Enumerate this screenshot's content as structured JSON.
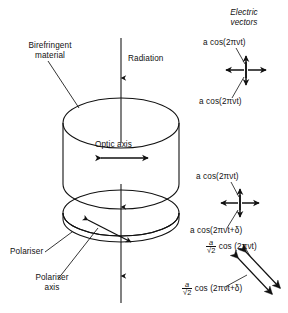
{
  "diagram": {
    "type": "optics-schematic",
    "background_color": "#ffffff",
    "line_color": "#111111"
  },
  "labels": {
    "birefringent_material": "Birefringent\nmaterial",
    "birefringent_material_line1": "Birefringent",
    "birefringent_material_line2": "material",
    "radiation": "Radiation",
    "optic_axis": "Optic axis",
    "polariser": "Polariser",
    "polariser_axis_line1": "Polariser",
    "polariser_axis_line2": "axis",
    "electric_vectors_line1": "Electric",
    "electric_vectors_line2": "vectors"
  },
  "formulas": {
    "top_upper": "a cos(2πνt)",
    "top_lower": "a cos(2πνt)",
    "mid_upper": "a cos(2πνt)",
    "mid_lower": "a cos(2πνt+δ)",
    "diag_upper_numerator": "a",
    "diag_upper_denominator": "√2",
    "diag_upper_rest": "cos (2πνt)",
    "diag_lower_numerator": "a",
    "diag_lower_denominator": "√2",
    "diag_lower_rest": "cos (2πνt+δ)"
  },
  "components": {
    "birefringent_cylinder": {
      "shape": "cylinder",
      "center_x": 121,
      "top_ellipse_y": 123,
      "bottom_ellipse_y": 184,
      "rx": 58,
      "ry": 25
    },
    "polariser_disc": {
      "shape": "thin-disc",
      "center_x": 121,
      "top_ellipse_y": 213,
      "bottom_ellipse_y": 254,
      "rx": 58,
      "ry": 23,
      "thickness": 6
    },
    "radiation_beam": {
      "x": 121,
      "top_y": 38,
      "bottom_y": 303,
      "direction": "downward"
    }
  },
  "arrows": {
    "optic_axis_arrow": {
      "type": "double-headed-horizontal",
      "x1": 99,
      "x2": 150,
      "y": 158
    },
    "polariser_axis_arrow": {
      "type": "double-headed-diagonal",
      "x1": 86,
      "y1": 219,
      "x2": 132,
      "y2": 243
    },
    "electric_vector_cross_top": {
      "type": "four-way-cross",
      "cx": 246,
      "cy": 70,
      "arm": 17
    },
    "electric_vector_cross_mid": {
      "type": "four-way-cross",
      "cx": 240,
      "cy": 203,
      "arm": 16
    },
    "resolved_diagonal_pair": {
      "type": "double-headed-diagonal-pair",
      "x1": 240,
      "y1": 255,
      "x2": 276,
      "y2": 294
    }
  }
}
